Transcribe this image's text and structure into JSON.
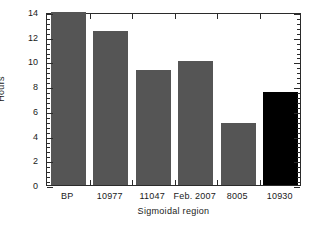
{
  "chart_data": {
    "type": "bar",
    "title": "",
    "xlabel": "Sigmoidal region",
    "ylabel": "Hours",
    "categories": [
      "BP",
      "10977",
      "11047",
      "Feb. 2007",
      "8005",
      "10930"
    ],
    "values": [
      14.3,
      12.5,
      9.3,
      10.0,
      5.0,
      7.5
    ],
    "bar_colors": [
      "#555555",
      "#555555",
      "#555555",
      "#555555",
      "#555555",
      "#000000"
    ],
    "ylim": [
      0,
      14
    ],
    "xlim": [
      0,
      6
    ],
    "y_ticks": [
      0,
      2,
      4,
      6,
      8,
      10,
      12,
      14
    ],
    "y_tick_labels": [
      "0",
      "2",
      "4",
      "6",
      "8",
      "10",
      "12",
      "14"
    ],
    "y_minor_ticks_per_interval": 4,
    "grid": false,
    "legend": null
  },
  "figure": {
    "background_color": "#ffffff",
    "frame_color": "#2b2b2b",
    "accent_color": "#555555",
    "highlight_color": "#000000"
  }
}
